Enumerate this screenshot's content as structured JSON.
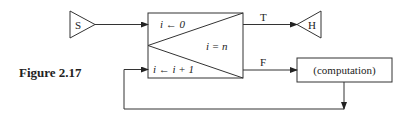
{
  "figure": {
    "caption": "Figure 2.17"
  },
  "nodes": {
    "start": {
      "label": "S",
      "shape": "triangle"
    },
    "halt": {
      "label": "H",
      "shape": "triangle"
    },
    "loop_box": {
      "init": "i ← 0",
      "increment": "i ← i + 1",
      "test": "i = n"
    },
    "computation": {
      "label": "(computation)"
    }
  },
  "edges": {
    "true_label": "T",
    "false_label": "F"
  },
  "colors": {
    "stroke": "#333333",
    "text": "#222222",
    "background": "#ffffff"
  }
}
